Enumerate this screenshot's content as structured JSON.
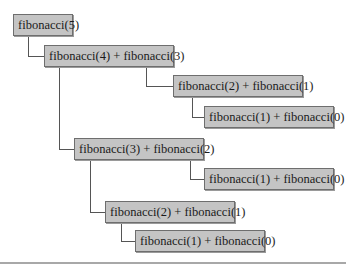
{
  "diagram": {
    "nodes": [
      {
        "id": "n1",
        "label": "fibonacci(5)"
      },
      {
        "id": "n2",
        "label": "fibonacci(4) + fibonacci(3)"
      },
      {
        "id": "n3",
        "label": "fibonacci(2) + fibonacci(1)"
      },
      {
        "id": "n4",
        "label": "fibonacci(1) + fibonacci(0)"
      },
      {
        "id": "n5",
        "label": "fibonacci(3) + fibonacci(2)"
      },
      {
        "id": "n6",
        "label": "fibonacci(1) + fibonacci(0)"
      },
      {
        "id": "n7",
        "label": "fibonacci(2) + fibonacci(1)"
      },
      {
        "id": "n8",
        "label": "fibonacci(1) + fibonacci(0)"
      }
    ],
    "edges": [
      [
        "n1",
        "n2"
      ],
      [
        "n2",
        "n3"
      ],
      [
        "n3",
        "n4"
      ],
      [
        "n2",
        "n5"
      ],
      [
        "n5",
        "n6"
      ],
      [
        "n5",
        "n7"
      ],
      [
        "n7",
        "n8"
      ]
    ],
    "colors": {
      "node_fill": "#c4c4c4",
      "node_border": "#6e6e6e",
      "line": "#555555"
    }
  }
}
